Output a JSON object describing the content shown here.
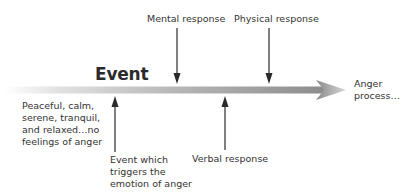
{
  "diagram": {
    "type": "timeline",
    "title": "Event",
    "start_label": "Peaceful, calm,\nserene, tranquil,\nand relaxed…no\nfeelings of anger",
    "end_label": "Anger\nprocess…",
    "above_labels": [
      {
        "id": "mental",
        "text": "Mental response"
      },
      {
        "id": "physical",
        "text": "Physical response"
      }
    ],
    "below_labels": [
      {
        "id": "trigger",
        "text": "Event which\ntriggers the\nemotion of anger"
      },
      {
        "id": "verbal",
        "text": "Verbal response"
      }
    ],
    "colors": {
      "bar_start": "#ffffff",
      "bar_end": "#8a8a8a",
      "arrow": "#2a2a2a",
      "text": "#333333"
    }
  }
}
